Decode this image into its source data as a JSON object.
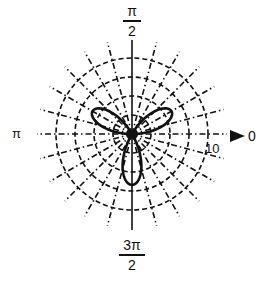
{
  "chart_data": {
    "type": "polar_line",
    "title": "",
    "series": [
      {
        "name": "rose curve",
        "style": "solid-thick",
        "color": "#111111",
        "petals": [
          {
            "angle_deg": 30,
            "max_r": 6.0
          },
          {
            "angle_deg": 150,
            "max_r": 6.0
          },
          {
            "angle_deg": 270,
            "max_r": 6.7
          }
        ]
      }
    ],
    "radial_axis": {
      "ticks": [
        2.5,
        5,
        7.5,
        10
      ],
      "labeled_tick": "10",
      "range": [
        0,
        10
      ]
    },
    "angular_axis": {
      "spoke_step_deg": 15,
      "labels": {
        "0": "0",
        "90": "π/2",
        "180": "π",
        "270": "3π/2"
      }
    },
    "grid": {
      "circles": "dashed",
      "spokes": "dash-dot"
    }
  },
  "labels": {
    "top_num": "π",
    "top_den": "2",
    "bottom_num": "3π",
    "bottom_den": "2",
    "left": "π",
    "right": "0",
    "radial_tick": "10"
  },
  "geometry": {
    "cx": 132,
    "cy": 134,
    "ring_radii_px": [
      19,
      38,
      57,
      76
    ],
    "outer_px": 95,
    "scale_px_per_unit": 7.6,
    "petal_length_px": {
      "30": 45,
      "150": 45,
      "270": 51
    }
  }
}
